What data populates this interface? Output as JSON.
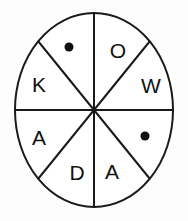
{
  "figure": {
    "background_color": "#fdfdfd",
    "stroke_color": "#1a1a1a",
    "fill_color": "#ffffff"
  },
  "wheel": {
    "center_x": 94,
    "center_y": 110,
    "radius_x": 79,
    "radius_y": 97,
    "sector_count": 8
  },
  "sectors": [
    {
      "id": "sector-1",
      "position": "top-left-inner",
      "content_type": "dot",
      "label": "",
      "icon": "filled-dot-icon",
      "cx": 69,
      "cy": 47,
      "r": 4.5
    },
    {
      "id": "sector-2",
      "position": "left-upper",
      "content_type": "letter",
      "label": "K",
      "x": 39,
      "y": 84
    },
    {
      "id": "sector-3",
      "position": "top-right-inner",
      "content_type": "letter",
      "label": "O",
      "x": 118,
      "y": 50
    },
    {
      "id": "sector-4",
      "position": "right-upper",
      "content_type": "letter",
      "label": "W",
      "x": 151,
      "y": 85
    },
    {
      "id": "sector-5",
      "position": "left-lower",
      "content_type": "letter",
      "label": "A",
      "x": 39,
      "y": 137
    },
    {
      "id": "sector-6",
      "position": "bottom-left-inner",
      "content_type": "letter",
      "label": "D",
      "x": 77,
      "y": 172
    },
    {
      "id": "sector-7",
      "position": "bottom-right-inner",
      "content_type": "letter",
      "label": "A",
      "x": 112,
      "y": 171
    },
    {
      "id": "sector-8",
      "position": "right-lower",
      "content_type": "dot",
      "label": "",
      "icon": "filled-dot-icon",
      "cx": 145,
      "cy": 136,
      "r": 4.5
    }
  ],
  "dividers": [
    {
      "id": "divider-vertical",
      "name": "vertical-divider",
      "x1": 94,
      "y1": 13,
      "x2": 94,
      "y2": 208
    },
    {
      "id": "divider-horizontal",
      "name": "horizontal-divider",
      "x1": 15,
      "y1": 110,
      "x2": 173,
      "y2": 110
    },
    {
      "id": "divider-diagonal-nw-se",
      "name": "diagonal-divider-nw-se",
      "x1": 38,
      "y1": 41,
      "x2": 150,
      "y2": 179
    },
    {
      "id": "divider-diagonal-ne-sw",
      "name": "diagonal-divider-ne-sw",
      "x1": 150,
      "y1": 41,
      "x2": 38,
      "y2": 179
    }
  ]
}
